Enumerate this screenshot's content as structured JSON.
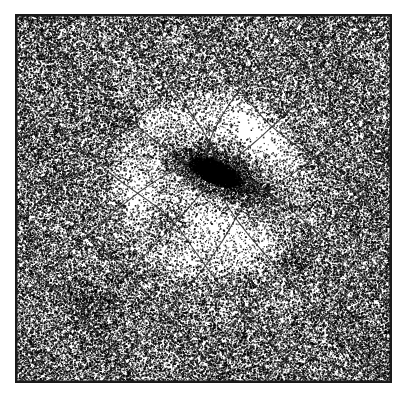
{
  "figure": {
    "caption": "",
    "type": "stipple-halftone-illustration",
    "medium": "black ink stipple / dithered halftone on white paper",
    "image_width": 416,
    "image_height": 399,
    "background_color": "#ffffff",
    "ink_color": "#000000"
  },
  "frame": {
    "name": "image-border-frame",
    "left": 15,
    "top": 14,
    "right": 392,
    "bottom": 383,
    "width": 377,
    "height": 369,
    "stroke_width": 2.5,
    "stroke_color": "#1a1a1a",
    "margin_color": "#ffffff"
  },
  "field": {
    "description": "Dense random stipple field filling the framed square, modulated by radial brightness around the lensing centre",
    "base_density": 0.3,
    "dot_size_min": 0.7,
    "dot_size_max": 1.7,
    "seed": 20240613
  },
  "singularity": {
    "name": "lens-core",
    "center_x": 215,
    "center_y": 172,
    "core_radius": 9,
    "core_angle_deg": 22,
    "core_elongation": 2.35,
    "core_extent_x": 46,
    "core_extent_y": 19,
    "core_density": 0.97,
    "color": "#000000"
  },
  "halo": {
    "name": "bright-halo-annulus",
    "center_x": 210,
    "center_y": 185,
    "inner_radius": 30,
    "outer_radius": 105,
    "min_density_factor": 0.1,
    "description": "Low-density bright annulus (cleared ring) surrounding the core"
  },
  "secondary_clumps": [
    {
      "name": "clump-lower-left",
      "x": 163,
      "y": 222,
      "radius": 26,
      "density": 0.62
    },
    {
      "name": "clump-lower-right",
      "x": 296,
      "y": 262,
      "radius": 22,
      "density": 0.5
    },
    {
      "name": "clump-upper-left",
      "x": 118,
      "y": 118,
      "radius": 20,
      "density": 0.46
    },
    {
      "name": "clump-right-plume",
      "x": 268,
      "y": 196,
      "radius": 30,
      "density": 0.55
    },
    {
      "name": "clump-bottom-left",
      "x": 92,
      "y": 300,
      "radius": 22,
      "density": 0.44
    }
  ],
  "grid": {
    "name": "deformed-coordinate-grid",
    "family_a_angle_deg": 45,
    "family_b_angle_deg": -45,
    "cell_diagonal_px": 60,
    "cell_side_px": 42,
    "line_count_a": 13,
    "line_count_b": 13,
    "line_width": 1.15,
    "line_color": "#2b2b2b",
    "lensing_strength": 2100,
    "softening": 26,
    "description": "Two orthogonal families of straight lines at plus and minus 45 degrees, deflected radially inward toward the lens core"
  },
  "chart_data": {
    "type": "scatter",
    "xlabel": "",
    "ylabel": "",
    "xlim": [
      15,
      392
    ],
    "ylim": [
      14,
      383
    ],
    "grid": true,
    "legend": "none",
    "annotations": [
      "central dark singularity core",
      "bright halo annulus",
      "undistorted diagonal grid at field edges"
    ],
    "series": [
      {
        "name": "stipple-density-field",
        "description": "Point density as function of radius from lens centre (215,172)",
        "x": [
          0,
          15,
          30,
          45,
          60,
          75,
          90,
          105,
          120,
          150,
          180,
          210,
          260
        ],
        "values": [
          0.97,
          0.72,
          0.24,
          0.1,
          0.09,
          0.11,
          0.15,
          0.22,
          0.29,
          0.32,
          0.33,
          0.33,
          0.34
        ]
      }
    ]
  }
}
